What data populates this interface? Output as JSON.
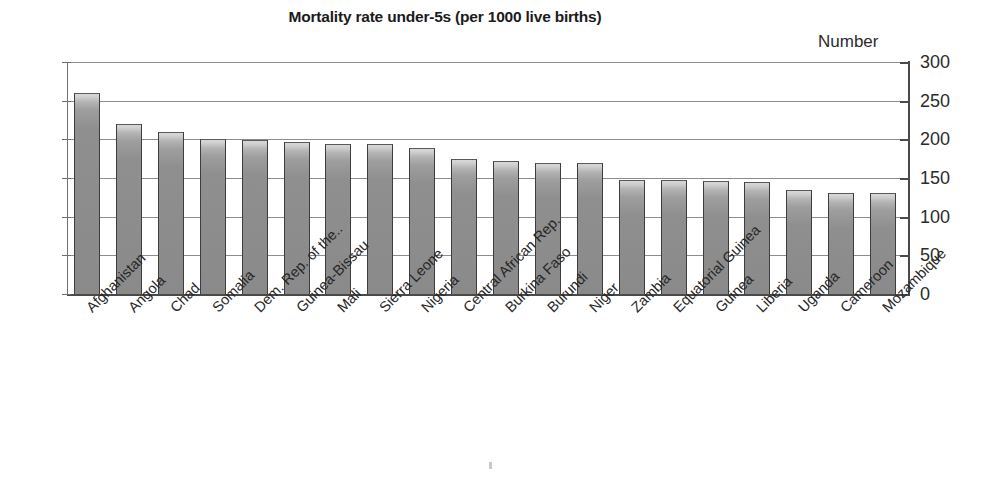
{
  "chart_data": {
    "type": "bar",
    "title": "Mortality rate under-5s (per 1000 live births)",
    "axis_unit_label": "Number",
    "xlabel": "",
    "ylabel": "Number",
    "ylim": [
      0,
      300
    ],
    "ytick_step": 50,
    "yticks": [
      300,
      250,
      200,
      150,
      100,
      50,
      0
    ],
    "ytick_labels": [
      "300",
      "250",
      "200",
      "150",
      "100",
      "50",
      "0"
    ],
    "grid": true,
    "grid_axis": "y",
    "axis_position": "right",
    "legend": false,
    "legend_position": "none",
    "categories": [
      "Afghanistan",
      "Angola",
      "Chad",
      "Somalia",
      "Dem. Rep. of the..",
      "Guinea-Bissau",
      "Mali",
      "Sierra Leone",
      "Nigeria",
      "Central African Rep.",
      "Burkina Faso",
      "Burundi",
      "Niger",
      "Zambia",
      "Equatorial Guinea",
      "Guinea",
      "Liberia",
      "Uganda",
      "Cameroon",
      "Mozambique"
    ],
    "values": [
      260,
      220,
      209,
      200,
      199,
      196,
      194,
      194,
      189,
      174,
      172,
      170,
      169,
      148,
      148,
      146,
      145,
      135,
      131,
      130
    ],
    "bar_color": "#8f8f8f",
    "bar_edge_color": "#3d3d3d",
    "grid_color": "#8c8c8c",
    "axis_color": "#4a4a4a",
    "text_color": "#231f20"
  }
}
